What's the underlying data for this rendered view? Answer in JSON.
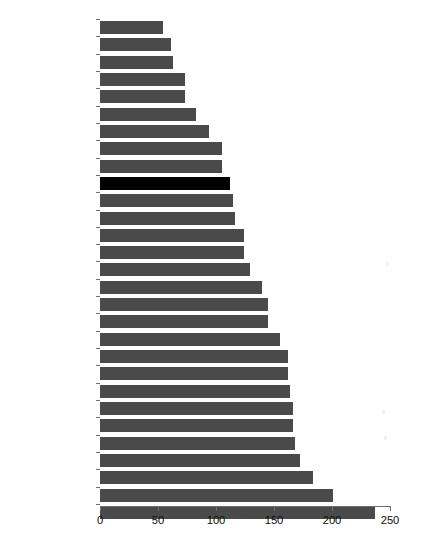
{
  "chart_data": {
    "type": "bar",
    "orientation": "horizontal",
    "title": "",
    "subtitle": "",
    "xlabel": "",
    "ylabel": "",
    "xlim": [
      0,
      250
    ],
    "xticks": [
      0,
      50,
      100,
      150,
      200,
      250
    ],
    "xtick_labels": [
      "0",
      "50",
      "100",
      "150",
      "200",
      "250"
    ],
    "grid": false,
    "legend": false,
    "highlight_category": "Russia",
    "bar_color": "#4a4a4a",
    "highlight_color": "#000000",
    "axis_color": "#6e6e6e",
    "background_color": "#ffffff",
    "categories": [
      "Moldova",
      "Tajikistan",
      "Georgia",
      "Ukraine",
      "Serbia",
      "Bosnia",
      "Montenegro",
      "Macedonia",
      "Kyrgyzstan",
      "Russia",
      "Bulgaria",
      "Croatia",
      "Lithuania",
      "Latvia",
      "Romania",
      "Hungary",
      "Kazakhstan",
      "Czech Republic",
      "Estonia",
      "Armenia",
      "Slovenia",
      "Belarus",
      "Albania",
      "Uzbekistan",
      "Slovakia",
      "Mongolia",
      "Poland",
      "Azerbaijan",
      "Turkmenistan"
    ],
    "values": [
      54,
      61,
      63,
      73,
      73,
      83,
      94,
      105,
      105,
      112,
      115,
      116,
      124,
      124,
      129,
      140,
      145,
      145,
      155,
      162,
      162,
      164,
      166,
      166,
      168,
      172,
      184,
      201,
      237
    ]
  },
  "artifacts": {
    "top_text": "",
    "bottom_text_left": "",
    "bottom_text_right": ""
  }
}
